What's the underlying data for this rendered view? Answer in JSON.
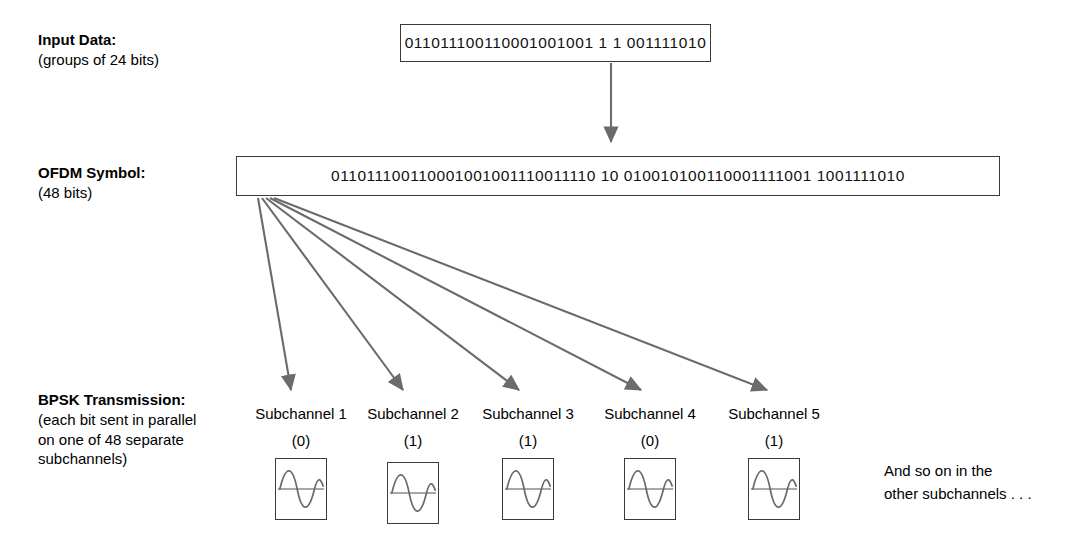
{
  "diagram": {
    "rows": {
      "input": {
        "label": "Input Data:",
        "sublabel": "(groups of 24 bits)",
        "bits": "011011100110001001001 1 1 001111010"
      },
      "ofdm": {
        "label": "OFDM Symbol:",
        "sublabel": "(48 bits)",
        "bits": "011011100110001001001110011110 10 010010100110001111001 1001111010"
      },
      "bpsk": {
        "label": "BPSK Transmission:",
        "sublabel_line1": "(each bit sent in parallel",
        "sublabel_line2": "on one of 48 separate",
        "sublabel_line3": "subchannels)"
      }
    },
    "subchannels": [
      {
        "name": "Subchannel 1",
        "bit": "(0)",
        "phase": "inverted"
      },
      {
        "name": "Subchannel 2",
        "bit": "(1)",
        "phase": "normal"
      },
      {
        "name": "Subchannel 3",
        "bit": "(1)",
        "phase": "normal"
      },
      {
        "name": "Subchannel 4",
        "bit": "(0)",
        "phase": "inverted"
      },
      {
        "name": "Subchannel 5",
        "bit": "(1)",
        "phase": "normal"
      }
    ],
    "note_line1": "And so on in the",
    "note_line2": "other subchannels . . .",
    "colors": {
      "box_stroke": "#3a3a3a",
      "arrow": "#6b6b6b",
      "wave": "#6b6b6b",
      "text": "#000000",
      "background": "#ffffff"
    }
  }
}
